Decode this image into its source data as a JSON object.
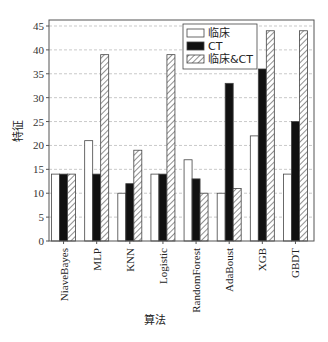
{
  "chart_data": {
    "type": "bar",
    "title": "",
    "xlabel": "算法",
    "ylabel": "特征",
    "ylim": [
      0,
      45
    ],
    "yticks": [
      0,
      5,
      10,
      15,
      20,
      25,
      30,
      35,
      40,
      45
    ],
    "grid": true,
    "legend_position": "upper center-right",
    "categories": [
      "NiaveBayes",
      "MLP",
      "KNN",
      "Logistic",
      "RandomForest",
      "AdaBoust",
      "XGB",
      "GBDT"
    ],
    "series": [
      {
        "name": "临床",
        "style": "white",
        "values": [
          14,
          21,
          10,
          14,
          17,
          10,
          22,
          14
        ]
      },
      {
        "name": "CT",
        "style": "black",
        "values": [
          14,
          14,
          12,
          14,
          13,
          33,
          36,
          25
        ]
      },
      {
        "name": "临床&CT",
        "style": "hatched",
        "values": [
          14,
          39,
          19,
          39,
          10,
          11,
          44,
          44
        ]
      }
    ]
  },
  "legend": [
    "临床",
    "CT",
    "临床&CT"
  ],
  "axis": {
    "x_label": "算法",
    "y_label": "特征"
  }
}
